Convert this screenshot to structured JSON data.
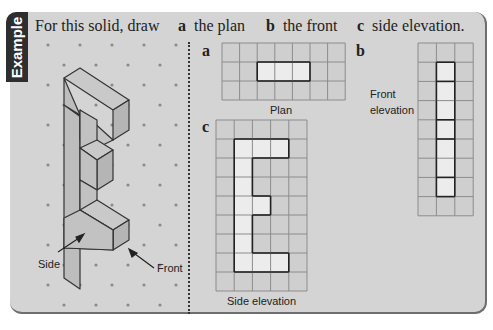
{
  "tab": {
    "label": "Example"
  },
  "title": {
    "intro": "For this solid, draw",
    "parts": [
      {
        "letter": "a",
        "text": "the plan"
      },
      {
        "letter": "b",
        "text": "the front"
      },
      {
        "letter": "c",
        "text": "side elevation."
      }
    ]
  },
  "solid": {
    "labels": {
      "side": "Side",
      "front": "Front"
    }
  },
  "plan": {
    "letter": "a",
    "caption": "Plan",
    "cols": 7,
    "rows": 3,
    "filled": [
      [
        1,
        2
      ],
      [
        1,
        3
      ],
      [
        1,
        4
      ]
    ]
  },
  "side_elevation": {
    "letter": "c",
    "caption": "Side elevation",
    "cols": 5,
    "rows": 9,
    "filled": [
      [
        1,
        1
      ],
      [
        1,
        2
      ],
      [
        1,
        3
      ],
      [
        2,
        1
      ],
      [
        3,
        1
      ],
      [
        4,
        1
      ],
      [
        4,
        2
      ],
      [
        5,
        1
      ],
      [
        6,
        1
      ],
      [
        7,
        1
      ],
      [
        7,
        2
      ],
      [
        7,
        3
      ]
    ]
  },
  "front_elevation": {
    "letter": "b",
    "caption_line1": "Front",
    "caption_line2": "elevation",
    "cols": 3,
    "rows": 9,
    "filled": [
      [
        1,
        1
      ],
      [
        2,
        1
      ],
      [
        3,
        1
      ],
      [
        4,
        1
      ],
      [
        5,
        1
      ],
      [
        6,
        1
      ],
      [
        7,
        1
      ]
    ]
  },
  "colors": {
    "background": "#d4d4d4",
    "tab": "#2e2e2e",
    "grid_line": "#8c8c8c",
    "grid_fill": "#cfcfcf",
    "highlight_fill": "#ececec",
    "outline": "#222222",
    "dot": "#8a8a8a"
  }
}
